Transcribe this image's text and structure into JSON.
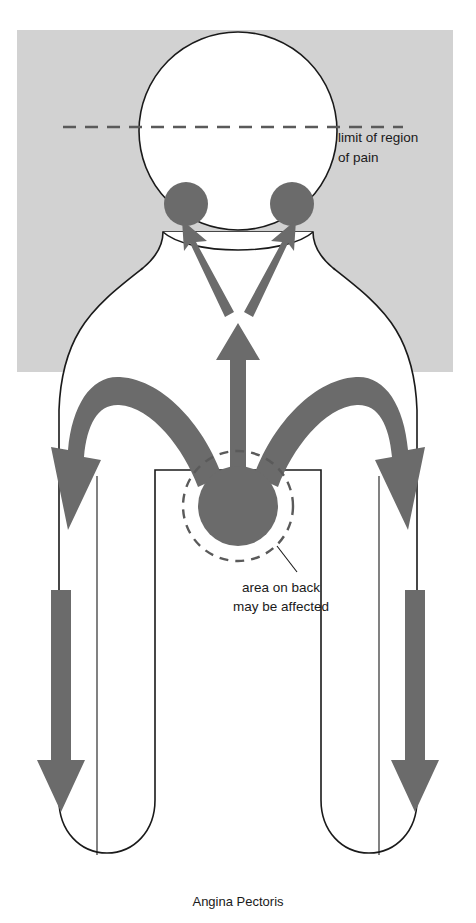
{
  "figure": {
    "caption": "Angina Pectoris"
  },
  "colors": {
    "background_field": "#d2d2d2",
    "body_fill": "#ffffff",
    "body_outline": "#1a1a1a",
    "arrow_fill": "#6b6b6b",
    "dashed_line": "#5a5a5a",
    "text": "#1a1a1a",
    "page": "#ffffff"
  },
  "annotations": {
    "limit_of_region": {
      "line1": "limit of region",
      "line2": "of pain"
    },
    "area_on_back": {
      "line1": "area on back",
      "line2": "may be affected"
    }
  },
  "regions": {
    "head": "head-circle",
    "jaw_left": "jaw-pain-spot-left",
    "jaw_right": "jaw-pain-spot-right",
    "sternum": "sternum-pain-circle",
    "back_zone": "back-pain-dashed-circle",
    "limit_line": "limit-of-pain-dashed-line"
  },
  "arrows": {
    "center_up": "sternum-to-throat-arrow",
    "jaw_left": "radiation-arrow-to-left-jaw",
    "jaw_right": "radiation-arrow-to-right-jaw",
    "upper_arm_left": "radiation-arrow-left-upper-arm",
    "upper_arm_right": "radiation-arrow-right-upper-arm",
    "forearm_left": "radiation-arrow-left-forearm",
    "forearm_right": "radiation-arrow-right-forearm"
  }
}
